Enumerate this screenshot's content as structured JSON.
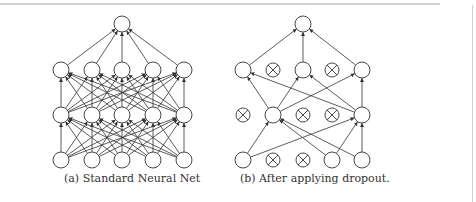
{
  "figure": {
    "subfigures": [
      {
        "id": "a",
        "caption": "(a) Standard Neural Net"
      },
      {
        "id": "b",
        "caption": "(b) After applying dropout."
      }
    ],
    "colors": {
      "stroke": "#333333",
      "background": "#ffffff",
      "rule": "#cfcfcf"
    }
  }
}
